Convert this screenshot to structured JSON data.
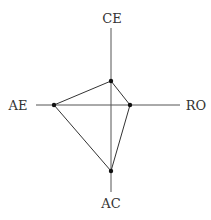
{
  "diagram": {
    "type": "radar",
    "axes": [
      {
        "label": "CE",
        "position": "top"
      },
      {
        "label": "RO",
        "position": "right"
      },
      {
        "label": "AC",
        "position": "bottom"
      },
      {
        "label": "AE",
        "position": "left"
      }
    ],
    "center": [
      111,
      105
    ],
    "points": {
      "CE": [
        111,
        81
      ],
      "RO": [
        130,
        105
      ],
      "AC": [
        111,
        171
      ],
      "AE": [
        54,
        105
      ]
    },
    "colors": {
      "line": "#333333",
      "point": "#111111"
    }
  }
}
